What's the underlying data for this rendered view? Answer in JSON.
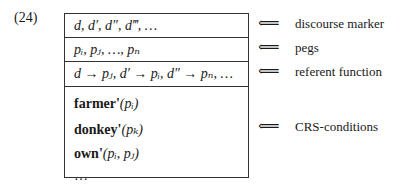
{
  "example_number": "(24)",
  "box": {
    "rows": {
      "discourse_markers": "d, d′, d″, d‴, …",
      "pegs": "pᵢ, pⱼ, …, pₙ",
      "referent_function": "d → pⱼ, d′ → pᵢ, d″ → pₙ, …"
    },
    "conditions": [
      {
        "pred": "farmer'",
        "args": "(pᵢ)"
      },
      {
        "pred": "donkey'",
        "args": "(pₖ)"
      },
      {
        "pred": "own'",
        "args": "(pᵢ, pⱼ)"
      },
      {
        "pred": "",
        "args": "…"
      }
    ]
  },
  "annotations": {
    "arrow": "⟸",
    "discourse_marker": "discourse marker",
    "pegs": "pegs",
    "referent_function": "referent function",
    "crs_conditions": "CRS-conditions"
  }
}
